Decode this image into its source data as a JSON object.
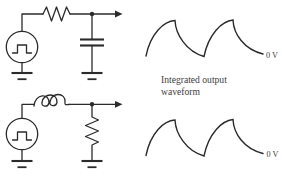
{
  "figure": {
    "caption_line1": "Integrated output",
    "caption_line2": "waveform"
  },
  "waveform_top": {
    "zero_label": "0 V"
  },
  "waveform_bottom": {
    "zero_label": "0 V"
  },
  "icons": {
    "top_circuit": [
      "square-wave-source-icon",
      "resistor-icon",
      "capacitor-icon",
      "ground-icon",
      "junction-dot",
      "output-arrow-icon"
    ],
    "bottom_circuit": [
      "square-wave-source-icon",
      "inductor-icon",
      "resistor-icon",
      "ground-icon",
      "junction-dot",
      "output-arrow-icon"
    ]
  },
  "colors": {
    "background": "#ffffff",
    "line": "#2b2b2b",
    "text": "#3d3d3d"
  }
}
